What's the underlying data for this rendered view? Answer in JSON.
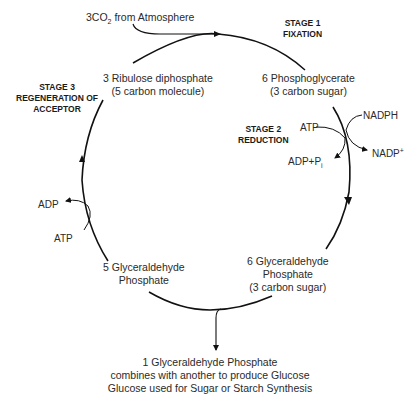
{
  "co2_input": {
    "prefix": "3CO",
    "sub": "2",
    "suffix": " from Atmosphere"
  },
  "stages": [
    {
      "line1": "STAGE 1",
      "line2": "FIXATION"
    },
    {
      "line1": "STAGE 2",
      "line2": "REDUCTION"
    },
    {
      "line1": "STAGE 3",
      "line2": "REGENERATION OF",
      "line3": "ACCEPTOR"
    }
  ],
  "molecules": {
    "rubp": {
      "line1": "3 Ribulose diphosphate",
      "line2": "(5 carbon molecule)"
    },
    "pga": {
      "line1": "6 Phosphoglycerate",
      "line2": "(3 carbon sugar)"
    },
    "g3p6": {
      "line1": "6 Glyceraldehyde",
      "line2": "Phosphate",
      "line3": "(3 carbon sugar)"
    },
    "g3p5": {
      "line1": "5 Glyceraldehyde",
      "line2": "Phosphate"
    }
  },
  "cofactors": {
    "reduction_atp": "ATP",
    "reduction_nadph": "NADPH",
    "reduction_adp": "ADP+P",
    "reduction_adp_sub": "i",
    "reduction_nadp": "NADP",
    "reduction_nadp_sup": "+",
    "regen_adp": "ADP",
    "regen_atp": "ATP"
  },
  "output": {
    "line1": "1 Glyceraldehyde Phosphate",
    "line2": "combines with another to produce Glucose",
    "line3": "Glucose used for Sugar or Starch Synthesis"
  },
  "colors": {
    "line": "#111111",
    "text": "#2a2a2a"
  }
}
